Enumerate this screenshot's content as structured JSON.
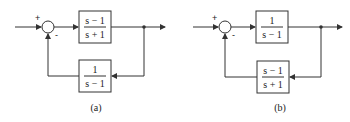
{
  "diagrams": [
    {
      "id": "a",
      "caption": "(a)",
      "summing_junction": {
        "plus_label": "+",
        "minus_label": "-"
      },
      "forward_block": {
        "numerator": "s − 1",
        "denominator": "s + 1"
      },
      "feedback_block": {
        "numerator": "1",
        "denominator": "s − 1"
      }
    },
    {
      "id": "b",
      "caption": "(b)",
      "summing_junction": {
        "plus_label": "+",
        "minus_label": "-"
      },
      "forward_block": {
        "numerator": "1",
        "denominator": "s − 1"
      },
      "feedback_block": {
        "numerator": "s − 1",
        "denominator": "s + 1"
      }
    }
  ],
  "colors": {
    "line": "#333333",
    "background": "#ffffff"
  }
}
